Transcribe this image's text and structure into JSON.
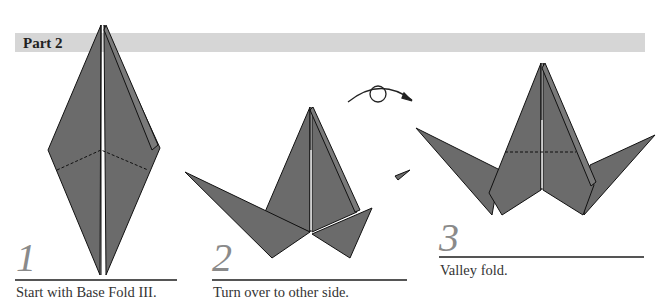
{
  "header": {
    "title": "Part 2",
    "bar_color": "#d6d6d6"
  },
  "colors": {
    "paper": "#6b6b6b",
    "edge": "#111111",
    "number": "#8a8a8a"
  },
  "steps": [
    {
      "number": "1",
      "caption": "Start with Base Fold III."
    },
    {
      "number": "2",
      "caption": "Turn over to other side."
    },
    {
      "number": "3",
      "caption": "Valley fold."
    }
  ],
  "symbols": {
    "turn_over": "turn-over-arrow"
  }
}
